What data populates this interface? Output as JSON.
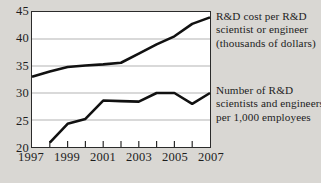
{
  "chart_data": {
    "type": "line",
    "title": "",
    "xlabel": "",
    "ylabel": "",
    "x": [
      1997,
      1998,
      1999,
      2000,
      2001,
      2002,
      2003,
      2004,
      2005,
      2006,
      2007
    ],
    "xlim": [
      1997,
      2007
    ],
    "ylim": [
      20,
      45
    ],
    "yticks": [
      20,
      25,
      30,
      35,
      40,
      45
    ],
    "ytick_labels": [
      "20",
      "25",
      "30",
      "35",
      "40",
      "45"
    ],
    "xticks": [
      1997,
      1998,
      1999,
      2000,
      2001,
      2002,
      2003,
      2004,
      2005,
      2006,
      2007
    ],
    "xtick_labels": [
      "1997",
      "",
      "1999",
      "",
      "2001",
      "",
      "2003",
      "",
      "2005",
      "",
      "2007"
    ],
    "xtick_labels_shown": [
      "1997",
      "1999",
      "2001",
      "2003",
      "2005",
      "2007"
    ],
    "grid": true,
    "grid_axis": "y",
    "legend_position": "right",
    "line_color": "#111111",
    "grid_color": "#a9a9a9",
    "frame_color": "#2b2b2b",
    "plot_background": "#ffffff",
    "page_background": "#d9d7d3",
    "series": [
      {
        "name": "R&D cost per R&D scientist or engineer (thousands of dollars)",
        "x": [
          1997,
          1998,
          1999,
          2000,
          2001,
          2002,
          2003,
          2004,
          2005,
          2006,
          2007
        ],
        "values": [
          33.0,
          34.0,
          34.8,
          35.1,
          35.3,
          35.6,
          37.3,
          39.0,
          40.5,
          42.8,
          44.0
        ]
      },
      {
        "name": "Number of R&D scientists and engineers per 1,000 employees",
        "x": [
          1998,
          1999,
          2000,
          2001,
          2002,
          2003,
          2004,
          2005,
          2006,
          2007
        ],
        "values": [
          20.8,
          24.3,
          25.2,
          28.6,
          28.5,
          28.4,
          30.0,
          30.0,
          28.0,
          30.0
        ]
      }
    ]
  },
  "legend": {
    "upper": {
      "lines": [
        "R&D cost per R&D",
        "scientist or engineer",
        "(thousands of dollars)"
      ]
    },
    "lower": {
      "lines": [
        "Number of R&D",
        "scientists and engineers",
        "per 1,000 employees"
      ]
    }
  }
}
